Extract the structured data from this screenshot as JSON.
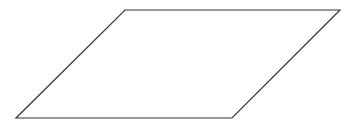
{
  "diagram": {
    "canvas": {
      "width": 353,
      "height": 124,
      "background": "#ffffff"
    },
    "shapes": [
      {
        "type": "parallelogram",
        "name": "parallelogram-shape",
        "points": [
          [
            125,
            10
          ],
          [
            340,
            10
          ],
          [
            232,
            118
          ],
          [
            16,
            118
          ]
        ],
        "stroke": "#333333",
        "stroke_width": 1.2,
        "fill": "#ffffff",
        "label": ""
      }
    ]
  }
}
